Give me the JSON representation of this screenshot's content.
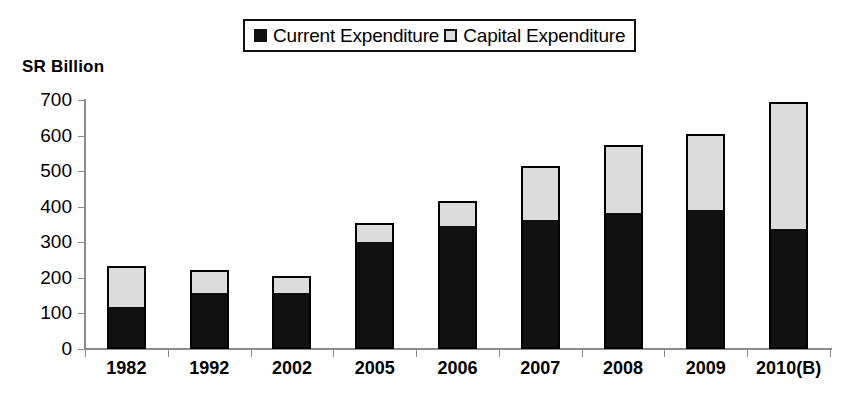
{
  "chart_data": {
    "type": "bar",
    "subtype": "stacked-vertical",
    "title": "",
    "xlabel": "",
    "ylabel": "SR Billion",
    "ylim": [
      0,
      700
    ],
    "y_ticks": [
      0,
      100,
      200,
      300,
      400,
      500,
      600,
      700
    ],
    "y_tick_labels": [
      "0",
      "100",
      "200",
      "300",
      "400",
      "500",
      "600",
      "700"
    ],
    "grid": false,
    "legend_position": "top-center",
    "categories": [
      "1982",
      "1992",
      "2002",
      "2005",
      "2006",
      "2007",
      "2008",
      "2009",
      "2010(B)"
    ],
    "series": [
      {
        "name": "Current Expenditure",
        "marker": "filled-square",
        "color": "#111111",
        "values": [
          118,
          157,
          157,
          300,
          345,
          362,
          382,
          390,
          337
        ]
      },
      {
        "name": "Capital Expenditure",
        "marker": "open-square",
        "color": "#dcdcdc",
        "values": [
          115,
          65,
          48,
          53,
          70,
          152,
          191,
          214,
          357
        ]
      }
    ],
    "totals": [
      233,
      222,
      205,
      353,
      415,
      514,
      573,
      604,
      694
    ]
  },
  "legend": {
    "items": [
      {
        "label": "Current Expenditure",
        "swatch": "filled-square-icon"
      },
      {
        "label": "Capital Expenditure",
        "swatch": "open-square-icon"
      }
    ]
  },
  "axis": {
    "y_title": "SR Billion"
  }
}
